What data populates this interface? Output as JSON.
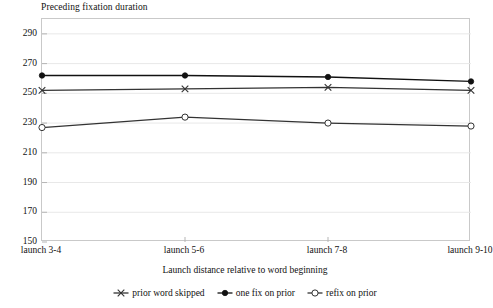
{
  "chart_data": {
    "type": "line",
    "title": "Preceding fixation duration",
    "xlabel": "Launch distance relative to word beginning",
    "ylabel": "Preceding fixation duration",
    "categories": [
      "launch 3-4",
      "launch 5-6",
      "launch 7-8",
      "launch 9-10"
    ],
    "ylim": [
      150,
      300
    ],
    "yticks": [
      290,
      270,
      250,
      230,
      210,
      190,
      170,
      150
    ],
    "grid": true,
    "legend_position": "bottom",
    "series": [
      {
        "name": "prior word skipped",
        "marker": "x-marker",
        "color": "#333333",
        "values": [
          252,
          253,
          254,
          252
        ]
      },
      {
        "name": "one fix on prior",
        "marker": "filled-circle-marker",
        "color": "#111111",
        "values": [
          262,
          262,
          261,
          258
        ]
      },
      {
        "name": "refix on prior",
        "marker": "open-circle-marker",
        "color": "#333333",
        "values": [
          227,
          234,
          230,
          228
        ]
      }
    ]
  }
}
